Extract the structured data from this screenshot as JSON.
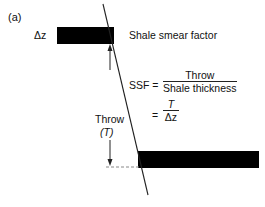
{
  "figure": {
    "panel_label": "(a)",
    "delta_z_label": "Δz",
    "title": "Shale smear factor",
    "throw_label": "Throw",
    "throw_symbol": "(T)",
    "equation": {
      "lhs": "SSF =",
      "numerator": "Throw",
      "denominator": "Shale thickness",
      "equals": "=",
      "numerator2": "T",
      "denominator2": "Δz"
    },
    "colors": {
      "bed": "#000000",
      "line": "#222222",
      "dashed": "#888888"
    }
  }
}
